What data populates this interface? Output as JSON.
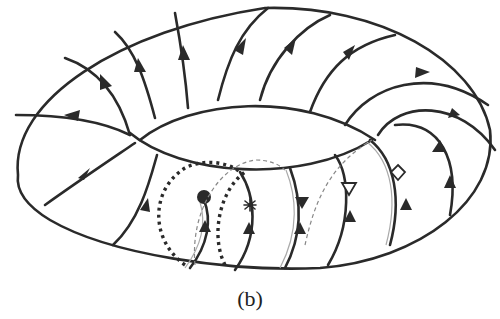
{
  "figure": {
    "caption": "(b)",
    "line_color": "#2a2a2a",
    "background": "#ffffff",
    "markers": [
      {
        "name": "filled-circle-marker",
        "shape": "filled-circle"
      },
      {
        "name": "star-marker",
        "shape": "star"
      },
      {
        "name": "filled-triangle-marker",
        "shape": "filled-down-triangle"
      },
      {
        "name": "open-triangle-marker",
        "shape": "open-down-triangle"
      },
      {
        "name": "open-diamond-marker",
        "shape": "open-diamond"
      },
      {
        "name": "filled-triangle-up-marker",
        "shape": "filled-up-triangle"
      }
    ]
  }
}
